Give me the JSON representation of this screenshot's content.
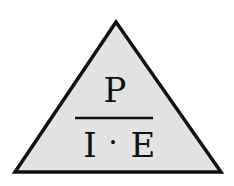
{
  "diagram": {
    "shape": "triangle",
    "fill_color": "#e2e2e2",
    "stroke_color": "#111111",
    "numerator": "P",
    "denominator_left": "I",
    "operator": "·",
    "denominator_right": "E"
  }
}
